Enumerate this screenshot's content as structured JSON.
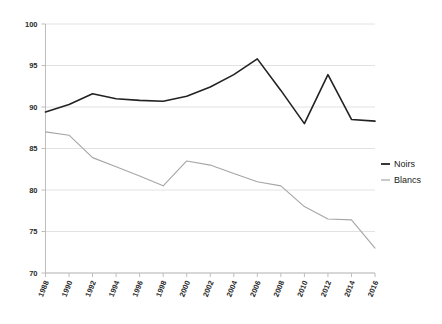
{
  "chart_data": {
    "type": "line",
    "title": "",
    "subtitle": "",
    "xlabel": "",
    "ylabel": "",
    "xlim": [
      1988,
      2016
    ],
    "ylim": [
      70,
      100
    ],
    "ytick_labels": [
      "100",
      "95",
      "90",
      "85",
      "80",
      "75",
      "70"
    ],
    "ytick_values": [
      100,
      95,
      90,
      85,
      80,
      75,
      70
    ],
    "xtick_labels": [
      "1988",
      "1990",
      "1992",
      "1994",
      "1996",
      "1998",
      "2000",
      "2002",
      "2004",
      "2006",
      "2008",
      "2010",
      "2012",
      "2014",
      "2016"
    ],
    "x": [
      1988,
      1990,
      1992,
      1994,
      1996,
      1998,
      2000,
      2002,
      2004,
      2006,
      2008,
      2010,
      2012,
      2014,
      2016
    ],
    "grid": true,
    "grid_axis": "y",
    "legend_position": "right",
    "series": [
      {
        "name": "Noirs",
        "color": "#222222",
        "values": [
          89.4,
          90.3,
          91.6,
          91.0,
          90.8,
          90.7,
          91.3,
          92.4,
          93.9,
          95.8,
          92.0,
          88.0,
          93.9,
          88.5,
          88.3
        ]
      },
      {
        "name": "Blancs",
        "color": "#a6a6a6",
        "values": [
          87.0,
          86.6,
          83.9,
          82.8,
          81.7,
          80.5,
          83.5,
          83.0,
          82.0,
          81.0,
          80.5,
          78.0,
          76.5,
          76.4,
          73.0
        ]
      }
    ]
  },
  "legend": {
    "items": [
      {
        "label": "Noirs",
        "color": "#222222"
      },
      {
        "label": "Blancs",
        "color": "#a6a6a6"
      }
    ]
  },
  "colors": {
    "grid": "#e2e2e2",
    "axis": "#bdbdbd",
    "background": "#ffffff",
    "tick_text": "#2b2b2b"
  }
}
